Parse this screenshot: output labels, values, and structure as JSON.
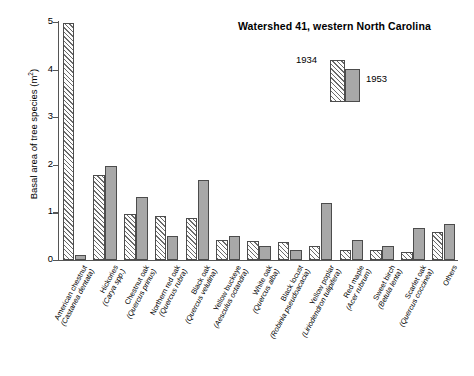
{
  "chart_data": {
    "type": "bar",
    "title": "Watershed 41, western North Carolina",
    "xlabel": "",
    "ylabel": "Basal area of tree species (m",
    "ylabel_sup": "2",
    "ylabel_suffix": ")",
    "ylim": [
      0,
      5
    ],
    "ytick_labels": [
      "0",
      "1",
      "2",
      "3",
      "4",
      "5"
    ],
    "ytick_values": [
      0,
      1,
      2,
      3,
      4,
      5
    ],
    "grid": false,
    "legend_position": "top-right",
    "categories": [
      "American chestnut (Castanea dentata)",
      "Hickories (Carya spp.)",
      "Chestnut oak (Quercus prinus)",
      "Northern red oak (Quercus rubra)",
      "Black oak (Quercus velutina)",
      "Yellow buckeye (Aesculus octandra)",
      "White oak (Quercus alba)",
      "Black locust (Robinia pseudoacacia)",
      "Yellow poplar (Liriodendron tulipifera)",
      "Red maple (Acer rubrum)",
      "Sweet birch (Betula lenta)",
      "Scarlet oak (Quercus coccinea)",
      "Others"
    ],
    "category_parts": [
      {
        "common": "American chestnut",
        "sci": "(Castanea dentata)"
      },
      {
        "common": "Hickories",
        "sci": "(Carya spp.)"
      },
      {
        "common": "Chestnut oak",
        "sci": "(Quercus prinus)"
      },
      {
        "common": "Northern red oak",
        "sci": "(Quercus rubra)"
      },
      {
        "common": "Black oak",
        "sci": "(Quercus velutina)"
      },
      {
        "common": "Yellow buckeye",
        "sci": "(Aesculus octandra)"
      },
      {
        "common": "White oak",
        "sci": "(Quercus alba)"
      },
      {
        "common": "Black locust",
        "sci": "(Robinia pseudoacacia)"
      },
      {
        "common": "Yellow poplar",
        "sci": "(Liriodendron tulipifera)"
      },
      {
        "common": "Red maple",
        "sci": "(Acer rubrum)"
      },
      {
        "common": "Sweet birch",
        "sci": "(Betula lenta)"
      },
      {
        "common": "Scarlet oak",
        "sci": "(Quercus coccinea)"
      },
      {
        "common": "Others",
        "sci": ""
      }
    ],
    "series": [
      {
        "name": "1934",
        "style": "hatched",
        "color": "#fdfdfd",
        "values": [
          4.97,
          1.78,
          0.97,
          0.93,
          0.88,
          0.43,
          0.4,
          0.38,
          0.3,
          0.22,
          0.2,
          0.17,
          0.58
        ]
      },
      {
        "name": "1953",
        "style": "solid",
        "color": "#a8a8a8",
        "values": [
          0.1,
          1.97,
          1.33,
          0.5,
          1.68,
          0.5,
          0.3,
          0.22,
          1.2,
          0.42,
          0.3,
          0.67,
          0.75
        ]
      }
    ]
  },
  "legend": {
    "entries": [
      {
        "label": "1934",
        "style": "hatched"
      },
      {
        "label": "1953",
        "style": "solid"
      }
    ]
  }
}
